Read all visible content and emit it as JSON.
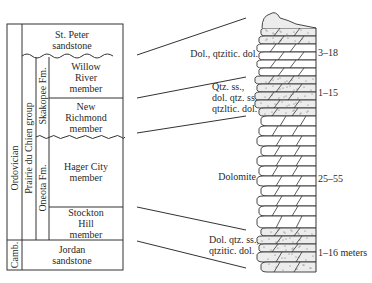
{
  "stratigraphy": {
    "periods": [
      {
        "name": "Ordovician"
      },
      {
        "name": "Camb."
      }
    ],
    "group": "Prairie du Chien group",
    "formations": [
      {
        "name": "Skakopee Fm."
      },
      {
        "name": "Oneota Fm."
      }
    ],
    "units": [
      {
        "lines": [
          "St. Peter",
          "sandstone"
        ]
      },
      {
        "lines": [
          "Willow",
          "River",
          "member"
        ]
      },
      {
        "lines": [
          "New",
          "Richmond",
          "member"
        ]
      },
      {
        "lines": [
          "Hager City",
          "member"
        ]
      },
      {
        "lines": [
          "Stockton",
          "Hill",
          "member"
        ]
      },
      {
        "lines": [
          "Jordan",
          "sandstone"
        ]
      }
    ]
  },
  "lithology": [
    {
      "lines": [
        "Dol., qtzitic. dol."
      ]
    },
    {
      "lines": [
        "Qtz. ss.,",
        "dol. qtz. ss.,",
        "qtzltic. dol."
      ]
    },
    {
      "lines": [
        "Dolomite"
      ]
    },
    {
      "lines": [
        "Dol. qtz. ss.,",
        "qtzitic. dol."
      ]
    }
  ],
  "thickness": [
    {
      "label": "3–18"
    },
    {
      "label": "1–15"
    },
    {
      "label": "25–55"
    },
    {
      "label": "1–16 meters"
    }
  ]
}
